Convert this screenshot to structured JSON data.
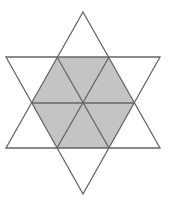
{
  "figure": {
    "colors": {
      "stroke": "#666666",
      "fill_shaded": "#c4c4c4",
      "background": "#ffffff"
    },
    "star_triangles": [
      {
        "name": "upward-triangle",
        "points": [
          [
            83,
            12
          ],
          [
            160,
            148
          ],
          [
            6,
            148
          ]
        ]
      },
      {
        "name": "downward-triangle",
        "points": [
          [
            6,
            57
          ],
          [
            160,
            57
          ],
          [
            83,
            194
          ]
        ]
      }
    ],
    "hexagon": {
      "center": [
        83,
        103
      ],
      "vertices": [
        [
          57,
          57
        ],
        [
          109,
          57
        ],
        [
          134,
          103
        ],
        [
          109,
          148
        ],
        [
          57,
          148
        ],
        [
          32,
          103
        ]
      ],
      "shaded": true,
      "subdivided_into_triangles": 6
    }
  }
}
